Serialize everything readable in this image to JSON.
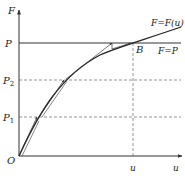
{
  "diagram": {
    "type": "force-displacement incremental solution diagram",
    "axes": {
      "y_label": "F",
      "x_label": "u",
      "origin_label": "O"
    },
    "levels": [
      {
        "label": "P",
        "sub": "",
        "style": "solid"
      },
      {
        "label": "P",
        "sub": "2",
        "style": "dashed"
      },
      {
        "label": "P",
        "sub": "1",
        "style": "dashed"
      }
    ],
    "curve_label": "F=F(u)",
    "load_line_label": "F=P",
    "point_label": "B",
    "x_marker_label": "u",
    "colors": {
      "line": "#333333",
      "dashed": "#555555",
      "background": "#ffffff"
    }
  }
}
